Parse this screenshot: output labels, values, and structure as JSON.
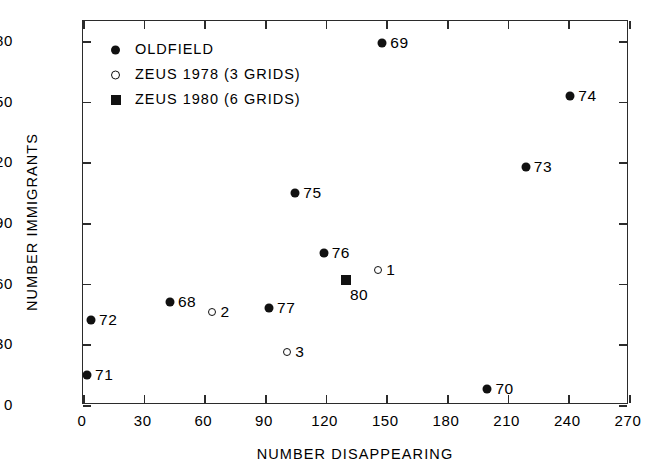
{
  "chart_data": {
    "type": "scatter",
    "title": "",
    "xlabel": "NUMBER DISAPPEARING",
    "ylabel": "NUMBER IMMIGRANTS",
    "xlim": [
      0,
      270
    ],
    "ylim": [
      0,
      190
    ],
    "xticks": [
      0,
      30,
      60,
      90,
      120,
      150,
      180,
      210,
      240,
      270
    ],
    "yticks": [
      0,
      30,
      60,
      90,
      120,
      150,
      180
    ],
    "xtick_labels": [
      "0",
      "30",
      "60",
      "90",
      "120",
      "150",
      "180",
      "210",
      "240",
      "270"
    ],
    "ytick_labels": [
      "0",
      "30",
      "60",
      "90",
      "120",
      "150",
      "180"
    ],
    "grid": false,
    "legend_position": "top-left",
    "series": [
      {
        "name": "OLDFIELD",
        "marker": "filled-circle",
        "color": "#111111",
        "points": [
          {
            "label": "69",
            "x": 148,
            "y": 179,
            "label_side": "right"
          },
          {
            "label": "74",
            "x": 241,
            "y": 153,
            "label_side": "right"
          },
          {
            "label": "73",
            "x": 219,
            "y": 118,
            "label_side": "right"
          },
          {
            "label": "75",
            "x": 105,
            "y": 105,
            "label_side": "right"
          },
          {
            "label": "76",
            "x": 119,
            "y": 75,
            "label_side": "right"
          },
          {
            "label": "68",
            "x": 43,
            "y": 51,
            "label_side": "right"
          },
          {
            "label": "77",
            "x": 92,
            "y": 48,
            "label_side": "right"
          },
          {
            "label": "72",
            "x": 4,
            "y": 42,
            "label_side": "right"
          },
          {
            "label": "71",
            "x": 2,
            "y": 15,
            "label_side": "right"
          },
          {
            "label": "70",
            "x": 200,
            "y": 8,
            "label_side": "right"
          }
        ]
      },
      {
        "name": "ZEUS 1978 (3 GRIDS)",
        "marker": "open-circle",
        "color": "#111111",
        "points": [
          {
            "label": "1",
            "x": 146,
            "y": 67,
            "label_side": "right"
          },
          {
            "label": "2",
            "x": 64,
            "y": 46,
            "label_side": "right"
          },
          {
            "label": "3",
            "x": 101,
            "y": 26,
            "label_side": "right"
          }
        ]
      },
      {
        "name": "ZEUS 1980 (6 GRIDS)",
        "marker": "filled-square",
        "color": "#111111",
        "points": [
          {
            "label": "80",
            "x": 130,
            "y": 62,
            "label_side": "below-right"
          }
        ]
      }
    ]
  },
  "legend": {
    "entries": [
      {
        "label": "OLDFIELD",
        "marker": "filled-circle"
      },
      {
        "label": "ZEUS 1978 (3 GRIDS)",
        "marker": "open-circle"
      },
      {
        "label": "ZEUS 1980 (6 GRIDS)",
        "marker": "filled-square"
      }
    ]
  },
  "colors": {
    "axis": "#2b2b2b",
    "marker": "#111111",
    "background": "#ffffff"
  }
}
